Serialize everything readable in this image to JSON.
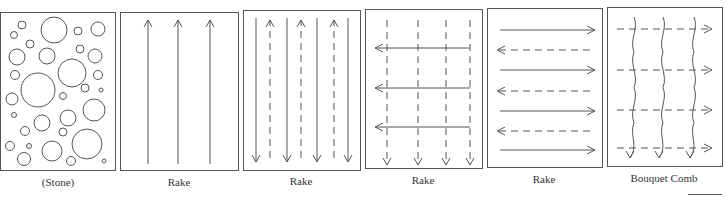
{
  "figure": {
    "stroke_color": "#555555",
    "panels": [
      {
        "id": "stone",
        "label": "(Stone)",
        "x": 0,
        "y": 12,
        "w": 115,
        "h": 158
      },
      {
        "id": "rake-1",
        "label": "Rake",
        "x": 120,
        "y": 12,
        "w": 118,
        "h": 158
      },
      {
        "id": "rake-2",
        "label": "Rake",
        "x": 243,
        "y": 10,
        "w": 117,
        "h": 160
      },
      {
        "id": "rake-3",
        "label": "Rake",
        "x": 365,
        "y": 9,
        "w": 117,
        "h": 159
      },
      {
        "id": "rake-4",
        "label": "Rake",
        "x": 487,
        "y": 8,
        "w": 115,
        "h": 159
      },
      {
        "id": "bouquet-comb",
        "label": "Bouquet Comb",
        "x": 607,
        "y": 7,
        "w": 115,
        "h": 159
      }
    ],
    "stone_circles": [
      [
        22,
        25,
        4
      ],
      [
        14,
        35,
        3.5
      ],
      [
        54,
        30,
        13
      ],
      [
        78,
        31,
        4
      ],
      [
        98,
        29,
        7
      ],
      [
        30,
        44,
        4
      ],
      [
        17,
        57,
        8
      ],
      [
        47,
        56,
        8
      ],
      [
        80,
        49,
        4
      ],
      [
        95,
        56,
        7
      ],
      [
        15,
        75,
        4.5
      ],
      [
        72,
        73,
        14
      ],
      [
        98,
        75,
        4.5
      ],
      [
        38,
        90,
        17
      ],
      [
        85,
        88,
        4
      ],
      [
        101,
        90,
        2
      ],
      [
        63,
        96,
        3.5
      ],
      [
        12,
        99,
        6
      ],
      [
        94,
        110,
        11
      ],
      [
        14,
        115,
        2.5
      ],
      [
        42,
        123,
        8
      ],
      [
        68,
        118,
        8
      ],
      [
        25,
        131,
        4.5
      ],
      [
        63,
        132,
        4
      ],
      [
        87,
        144,
        15
      ],
      [
        10,
        146,
        4.5
      ],
      [
        29,
        146,
        2.5
      ],
      [
        52,
        151,
        10
      ],
      [
        24,
        159,
        6.5
      ],
      [
        71,
        161,
        4.5
      ],
      [
        104,
        161,
        2
      ]
    ],
    "rake1_up_solid_x": [
      148,
      178,
      210
    ],
    "rake2_down_solid_x": [
      256,
      287,
      317,
      348
    ],
    "rake2_up_dashed_x": [
      270,
      301,
      334
    ],
    "rake3_down_dashed_x": [
      387,
      418,
      446,
      470
    ],
    "rake3_left_solid_y": [
      48,
      88,
      127
    ],
    "rake4_right_solid_y": [
      30,
      70,
      111,
      150
    ],
    "rake4_left_dashed_y": [
      50,
      91,
      131
    ],
    "bouquet_right_dashed_y": [
      29,
      70,
      110,
      148
    ],
    "bouquet_wavy_x": [
      634,
      663,
      694
    ]
  }
}
